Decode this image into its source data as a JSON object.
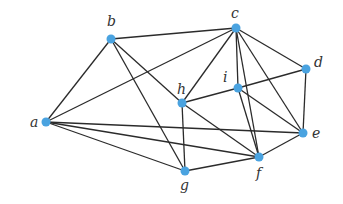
{
  "graph": {
    "node_color": "#4aa3e0",
    "edge_color": "#2b2b2b",
    "nodes": [
      {
        "id": "a",
        "label": "a",
        "x": 46,
        "y": 122,
        "lx": 30,
        "ly": 127
      },
      {
        "id": "b",
        "label": "b",
        "x": 111,
        "y": 39,
        "lx": 107,
        "ly": 26
      },
      {
        "id": "c",
        "label": "c",
        "x": 236,
        "y": 28,
        "lx": 231,
        "ly": 18
      },
      {
        "id": "d",
        "label": "d",
        "x": 306,
        "y": 69,
        "lx": 314,
        "ly": 67
      },
      {
        "id": "e",
        "label": "e",
        "x": 303,
        "y": 133,
        "lx": 312,
        "ly": 138
      },
      {
        "id": "f",
        "label": "f",
        "x": 259,
        "y": 157,
        "lx": 256,
        "ly": 178
      },
      {
        "id": "g",
        "label": "g",
        "x": 185,
        "y": 171,
        "lx": 180,
        "ly": 190
      },
      {
        "id": "h",
        "label": "h",
        "x": 182,
        "y": 103,
        "lx": 177,
        "ly": 94
      },
      {
        "id": "i",
        "label": "i",
        "x": 238,
        "y": 88,
        "lx": 223,
        "ly": 82
      }
    ],
    "edges": [
      [
        "a",
        "b"
      ],
      [
        "a",
        "c"
      ],
      [
        "a",
        "e"
      ],
      [
        "a",
        "f"
      ],
      [
        "a",
        "g"
      ],
      [
        "b",
        "c"
      ],
      [
        "b",
        "g"
      ],
      [
        "b",
        "h"
      ],
      [
        "c",
        "h"
      ],
      [
        "c",
        "i"
      ],
      [
        "c",
        "d"
      ],
      [
        "c",
        "e"
      ],
      [
        "c",
        "f"
      ],
      [
        "h",
        "i"
      ],
      [
        "i",
        "d"
      ],
      [
        "d",
        "e"
      ],
      [
        "h",
        "g"
      ],
      [
        "h",
        "f"
      ],
      [
        "i",
        "f"
      ],
      [
        "i",
        "e"
      ],
      [
        "e",
        "f"
      ],
      [
        "g",
        "f"
      ]
    ]
  }
}
